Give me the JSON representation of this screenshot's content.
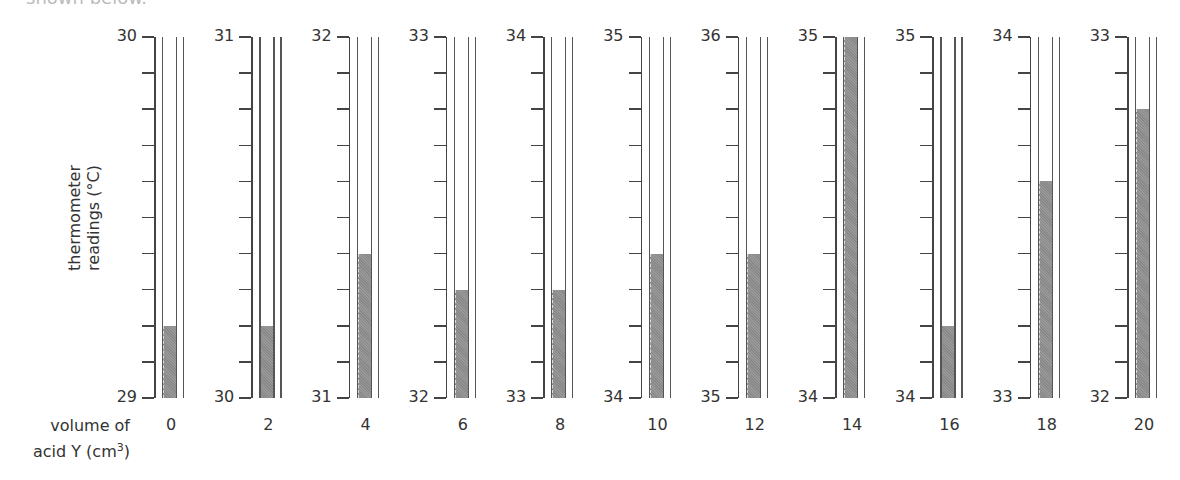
{
  "header": {
    "cropped_caption": "shown below."
  },
  "axes": {
    "y_label_line1": "thermometer",
    "y_label_line2": "readings (°C)",
    "x_label_line1": "volume of",
    "x_label_line2": "acid Y (cm",
    "x_label_sup": "3",
    "x_label_close": ")"
  },
  "colors": {
    "line": "#444444",
    "fill": "#8a8a8a",
    "background": "#ffffff"
  },
  "chart_data": {
    "type": "table",
    "xlabel": "volume of acid Y (cm³)",
    "ylabel": "thermometer readings (°C)",
    "ticks_per_thermometer": 11,
    "tick_step": 0.1,
    "thermometers": [
      {
        "volume": "0",
        "top": "30",
        "bottom": "29",
        "reading": 29.2
      },
      {
        "volume": "2",
        "top": "31",
        "bottom": "30",
        "reading": 30.2
      },
      {
        "volume": "4",
        "top": "32",
        "bottom": "31",
        "reading": 31.4
      },
      {
        "volume": "6",
        "top": "33",
        "bottom": "32",
        "reading": 32.3
      },
      {
        "volume": "8",
        "top": "34",
        "bottom": "33",
        "reading": 33.3
      },
      {
        "volume": "10",
        "top": "35",
        "bottom": "34",
        "reading": 34.4
      },
      {
        "volume": "12",
        "top": "36",
        "bottom": "35",
        "reading": 35.4
      },
      {
        "volume": "14",
        "top": "35",
        "bottom": "34",
        "reading": 35.0
      },
      {
        "volume": "16",
        "top": "35",
        "bottom": "34",
        "reading": 34.2
      },
      {
        "volume": "18",
        "top": "34",
        "bottom": "33",
        "reading": 33.6
      },
      {
        "volume": "20",
        "top": "33",
        "bottom": "32",
        "reading": 32.8
      }
    ],
    "categories": [
      "0",
      "2",
      "4",
      "6",
      "8",
      "10",
      "12",
      "14",
      "16",
      "18",
      "20"
    ],
    "values": [
      29.2,
      30.2,
      31.4,
      32.3,
      33.3,
      34.4,
      35.4,
      35.0,
      34.2,
      33.6,
      32.8
    ]
  }
}
